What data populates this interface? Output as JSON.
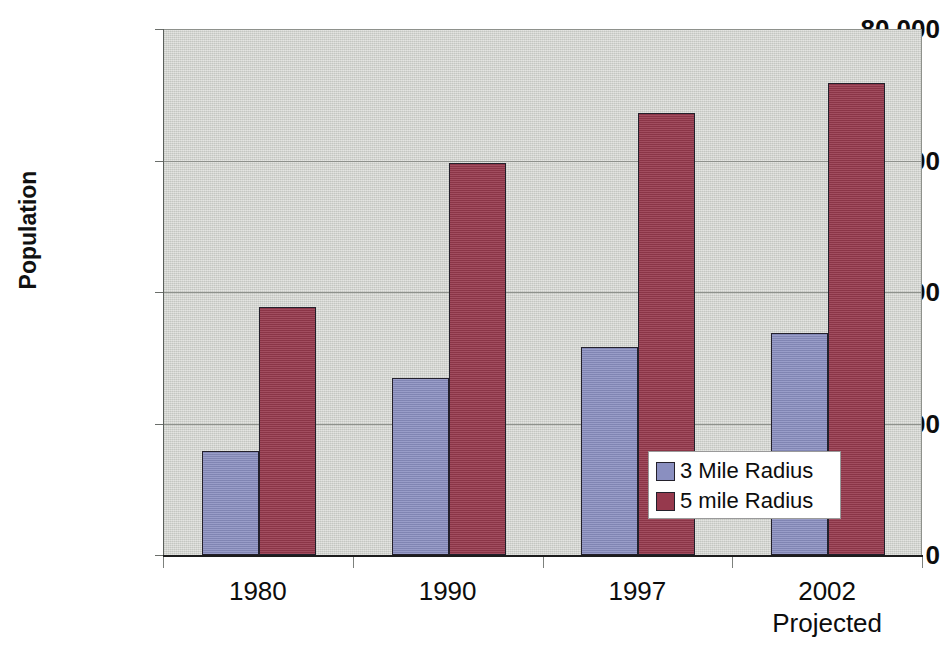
{
  "chart_data": {
    "type": "bar",
    "title": "",
    "subtitle": "",
    "xlabel": "",
    "ylabel": "Population",
    "categories": [
      "1980",
      "1990",
      "1997",
      "2002 Projected"
    ],
    "category_lines": [
      [
        "1980"
      ],
      [
        "1990"
      ],
      [
        "1997"
      ],
      [
        "2002",
        "Projected"
      ]
    ],
    "series": [
      {
        "name": "3 Mile Radius",
        "color": "#8a8fc0",
        "values": [
          15800,
          26900,
          31600,
          33800
        ]
      },
      {
        "name": "5 mile Radius",
        "color": "#96394d",
        "values": [
          37700,
          59600,
          67200,
          71800
        ]
      }
    ],
    "ylim": [
      0,
      80000
    ],
    "y_ticks": [
      0,
      20000,
      40000,
      60000,
      80000
    ],
    "y_tick_labels": [
      "0",
      "20,000",
      "40,000",
      "60,000",
      "80,000"
    ],
    "grid": true,
    "grid_axis": "y",
    "legend": {
      "position": "inside-bottom-right",
      "entries": [
        "3 Mile Radius",
        "5 mile Radius"
      ]
    },
    "plot_background": "#cfd1cc",
    "page_background": "#ffffff"
  },
  "axis": {
    "y_title": "Population"
  }
}
